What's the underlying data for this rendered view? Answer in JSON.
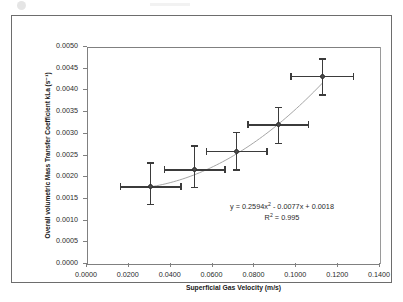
{
  "chart_data": {
    "type": "scatter",
    "title": "",
    "xlabel": "Superficial Gas Velocity (m/s)",
    "ylabel": "Overall volumetric Mass Transfer Coefficient kLa (s⁻¹)",
    "ylabel_plain": "Overall volumetric Mass Transfer Coefficient kLa (s-1)",
    "xlim": [
      0.0,
      0.14
    ],
    "ylim": [
      0.0,
      0.005
    ],
    "xticks": [
      0.0,
      0.02,
      0.04,
      0.06,
      0.08,
      0.1,
      0.12,
      0.14
    ],
    "yticks": [
      0.0,
      0.0005,
      0.001,
      0.0015,
      0.002,
      0.0025,
      0.003,
      0.0035,
      0.004,
      0.0045,
      0.005
    ],
    "xtick_labels": [
      "0.0000",
      "0.0200",
      "0.0400",
      "0.0600",
      "0.0800",
      "0.1000",
      "0.1200",
      "0.1400"
    ],
    "ytick_labels": [
      "0.0000",
      "0.0005",
      "0.0010",
      "0.0015",
      "0.0020",
      "0.0025",
      "0.0030",
      "0.0035",
      "0.0040",
      "0.0045",
      "0.0050"
    ],
    "grid": false,
    "legend": false,
    "marker_color": "#4a4a4a",
    "errorbar_color": "#3b3b3b",
    "trendline_color": "#a6a6a6",
    "points": [
      {
        "x": 0.03,
        "y": 0.0018,
        "xerr_minus": 0.0145,
        "xerr_plus": 0.0145,
        "yerr_minus": 0.0004,
        "yerr_plus": 0.00055
      },
      {
        "x": 0.051,
        "y": 0.00219,
        "xerr_minus": 0.0145,
        "xerr_plus": 0.0145,
        "yerr_minus": 0.0004,
        "yerr_plus": 0.00055
      },
      {
        "x": 0.071,
        "y": 0.00262,
        "xerr_minus": 0.0145,
        "xerr_plus": 0.0145,
        "yerr_minus": 0.00043,
        "yerr_plus": 0.00043
      },
      {
        "x": 0.091,
        "y": 0.00323,
        "xerr_minus": 0.0145,
        "xerr_plus": 0.0145,
        "yerr_minus": 0.00043,
        "yerr_plus": 0.0004
      },
      {
        "x": 0.112,
        "y": 0.00435,
        "xerr_minus": 0.015,
        "xerr_plus": 0.015,
        "yerr_minus": 0.00043,
        "yerr_plus": 0.0004
      }
    ],
    "trendline": {
      "type": "polynomial",
      "order": 2,
      "a": 0.2594,
      "b": -0.0077,
      "c": 0.0018,
      "r_squared": 0.995
    },
    "annotations": {
      "equation_prefix": "y = 0.2594x",
      "equation_exponent": "2",
      "equation_suffix": " - 0.0077x + 0.0018",
      "r_squared_prefix": "R",
      "r_squared_exponent": "2",
      "r_squared_suffix": " = 0.995"
    }
  }
}
